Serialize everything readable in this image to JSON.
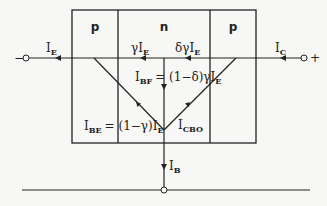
{
  "diagram": {
    "regions": [
      {
        "label": "p",
        "role": "emitter"
      },
      {
        "label": "n",
        "role": "base"
      },
      {
        "label": "p",
        "role": "collector"
      }
    ],
    "terminals": {
      "left": "−",
      "right": "+"
    },
    "currents": {
      "emitter": {
        "main": "I",
        "sub": "E"
      },
      "gamma_ie": {
        "prefix": "γI",
        "sub": "E"
      },
      "delta_gamma_ie": {
        "prefix": "δγI",
        "sub": "E"
      },
      "collector": {
        "main": "I",
        "sub": "C"
      },
      "ibf": {
        "main": "I",
        "sub": "BF",
        "rhs": "= (1−δ)γI",
        "rhs_sub": "E"
      },
      "ibe": {
        "main": "I",
        "sub": "BE",
        "rhs": "= (1−γ)I",
        "rhs_sub": "E"
      },
      "icbo": {
        "main": "I",
        "sub": "CBO"
      },
      "base": {
        "main": "I",
        "sub": "B"
      }
    },
    "colors": {
      "line": "#222222",
      "background": "#f7f7f5"
    }
  }
}
